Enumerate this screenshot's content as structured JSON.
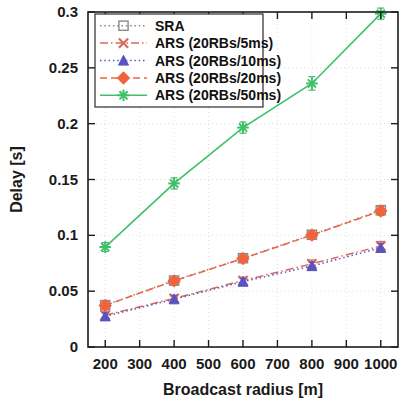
{
  "chart_data": {
    "type": "line",
    "title": "",
    "xlabel": "Broadcast radius [m]",
    "ylabel": "Delay [s]",
    "xlim": [
      150,
      1050
    ],
    "ylim": [
      0,
      0.3
    ],
    "grid": true,
    "legend_position": "top-left",
    "x": [
      200,
      400,
      600,
      800,
      1000
    ],
    "xticks": [
      200,
      300,
      400,
      500,
      600,
      700,
      800,
      900,
      1000
    ],
    "xtick_labels": [
      "200",
      "300",
      "400",
      "500",
      "600",
      "700",
      "800",
      "900",
      "1000"
    ],
    "yticks": [
      0,
      0.05,
      0.1,
      0.15,
      0.2,
      0.25,
      0.3
    ],
    "ytick_labels": [
      "0",
      "0.05",
      "0.1",
      "0.15",
      "0.2",
      "0.25",
      "0.3"
    ],
    "series": [
      {
        "name": "SRA",
        "label": "SRA",
        "color": "#8a8a8a",
        "marker": "square",
        "linestyle": "dotted",
        "values": [
          0.0375,
          0.0595,
          0.0795,
          0.1005,
          0.1225
        ],
        "errors": [
          0.0035,
          0.003,
          0.003,
          0.0035,
          0.004
        ]
      },
      {
        "name": "ARS (20RBs/5ms)",
        "label": "ARS (20RBs/5ms)",
        "color": "#d96a5e",
        "marker": "x",
        "linestyle": "dashdot",
        "values": [
          0.0285,
          0.0435,
          0.0595,
          0.0745,
          0.0905
        ],
        "errors": [
          0.003,
          0.003,
          0.003,
          0.0035,
          0.004
        ]
      },
      {
        "name": "ARS (20RBs/10ms)",
        "label": "ARS (20RBs/10ms)",
        "color": "#5a53c0",
        "marker": "triangle",
        "linestyle": "dotted",
        "values": [
          0.0275,
          0.0428,
          0.0585,
          0.0725,
          0.0888
        ],
        "errors": [
          0.003,
          0.003,
          0.003,
          0.0035,
          0.004
        ]
      },
      {
        "name": "ARS (20RBs/20ms)",
        "label": "ARS (20RBs/20ms)",
        "color": "#f0643c",
        "marker": "diamond",
        "linestyle": "dashed",
        "values": [
          0.0372,
          0.0592,
          0.0792,
          0.1002,
          0.1218
        ],
        "errors": [
          0.0035,
          0.003,
          0.003,
          0.0035,
          0.004
        ]
      },
      {
        "name": "ARS (20RBs/50ms)",
        "label": "ARS (20RBs/50ms)",
        "color": "#3fbf6a",
        "marker": "asterisk",
        "linestyle": "solid",
        "values": [
          0.0895,
          0.1465,
          0.1965,
          0.236,
          0.2985
        ],
        "errors": [
          0.004,
          0.005,
          0.005,
          0.006,
          0.005
        ]
      }
    ]
  }
}
